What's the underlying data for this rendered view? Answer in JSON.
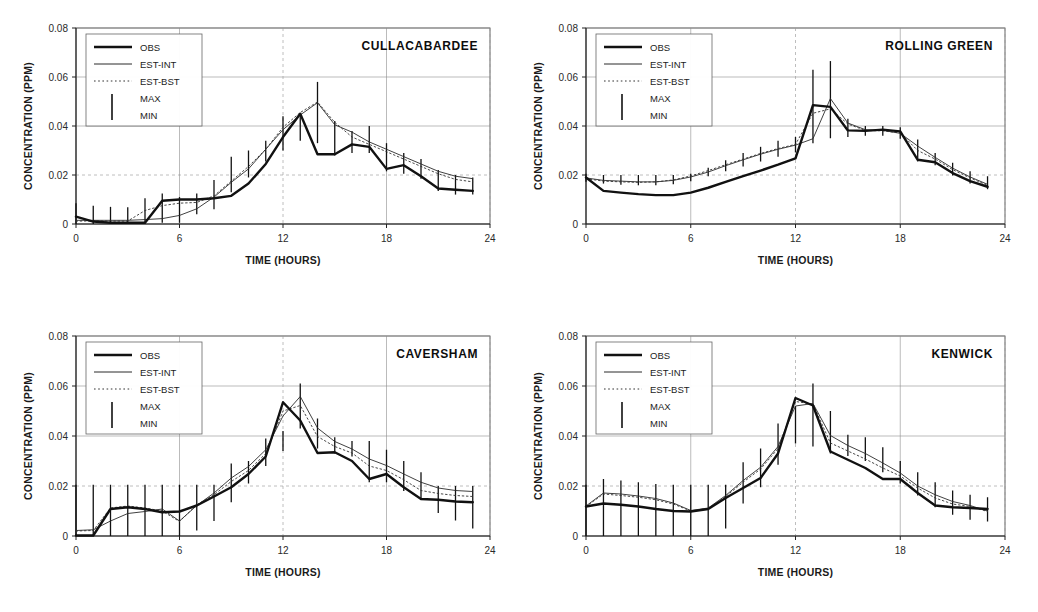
{
  "figure": {
    "panel_count": 4,
    "axis": {
      "xlabel": "TIME (HOURS)",
      "ylabel": "CONCENTRATION (PPM)",
      "xticks": [
        "0",
        "6",
        "12",
        "18",
        "24"
      ],
      "xtick_values": [
        0,
        6,
        12,
        18,
        24
      ],
      "yticks": [
        "0",
        "0.02",
        "0.04",
        "0.06",
        "0.08"
      ],
      "ytick_values": [
        0,
        0.02,
        0.04,
        0.06,
        0.08
      ],
      "xlim": [
        0,
        24
      ],
      "ylim": [
        0,
        0.08
      ],
      "grid": "dashed-light"
    },
    "legend": {
      "position": "top-left-inside",
      "entries": [
        {
          "label": "OBS",
          "marker": "thick-solid-line"
        },
        {
          "label": "EST-INT",
          "marker": "thin-solid-line"
        },
        {
          "label": "EST-BST",
          "marker": "dotted-line"
        },
        {
          "label": "MAX",
          "marker": "vertical-bar-top"
        },
        {
          "label": "MIN",
          "marker": "vertical-bar-bottom"
        }
      ]
    }
  },
  "chart_data": [
    {
      "type": "line",
      "title": "CULLACABARDEE",
      "xlabel": "TIME (HOURS)",
      "ylabel": "CONCENTRATION (PPM)",
      "xlim": [
        0,
        24
      ],
      "ylim": [
        0,
        0.08
      ],
      "x": [
        0,
        1,
        2,
        3,
        4,
        5,
        6,
        7,
        8,
        9,
        10,
        11,
        12,
        13,
        14,
        15,
        16,
        17,
        18,
        19,
        20,
        21,
        22,
        23
      ],
      "series": [
        {
          "name": "OBS",
          "values": [
            0.003,
            0.001,
            0.0005,
            0.0005,
            0.0005,
            0.0095,
            0.01,
            0.01,
            0.0105,
            0.0115,
            0.0165,
            0.0245,
            0.0355,
            0.045,
            0.0285,
            0.0285,
            0.0325,
            0.0315,
            0.0225,
            0.024,
            0.0195,
            0.0145,
            0.014,
            0.0135
          ]
        },
        {
          "name": "EST-INT",
          "values": [
            0.0015,
            0.0015,
            0.0015,
            0.0015,
            0.0018,
            0.0022,
            0.0035,
            0.0062,
            0.011,
            0.017,
            0.0225,
            0.0305,
            0.0385,
            0.0445,
            0.0495,
            0.0405,
            0.0375,
            0.0335,
            0.0305,
            0.0275,
            0.0245,
            0.0215,
            0.0195,
            0.0185
          ]
        },
        {
          "name": "EST-BST",
          "values": [
            0.0012,
            0.0012,
            0.0012,
            0.0012,
            0.0055,
            0.0075,
            0.0085,
            0.0088,
            0.0115,
            0.0175,
            0.0235,
            0.0305,
            0.0395,
            0.0455,
            0.0498,
            0.0415,
            0.0355,
            0.0325,
            0.0295,
            0.0265,
            0.0235,
            0.0205,
            0.0182,
            0.0172
          ]
        }
      ],
      "error_bars": {
        "name": "MAX-MIN",
        "max": [
          0.0085,
          0.0075,
          0.007,
          0.0068,
          0.0105,
          0.0125,
          0.011,
          0.0125,
          0.018,
          0.0275,
          0.03,
          0.034,
          0.044,
          0.045,
          0.058,
          0.042,
          0.038,
          0.04,
          0.033,
          0.029,
          0.0265,
          0.022,
          0.02,
          0.019
        ],
        "min": [
          0.0,
          0.0,
          0.0,
          0.0,
          0.0,
          0.0005,
          0.0005,
          0.004,
          0.006,
          0.013,
          0.019,
          0.0255,
          0.03,
          0.034,
          0.033,
          0.028,
          0.029,
          0.029,
          0.0215,
          0.0205,
          0.0185,
          0.0135,
          0.012,
          0.012
        ]
      }
    },
    {
      "type": "line",
      "title": "ROLLING GREEN",
      "xlabel": "TIME (HOURS)",
      "ylabel": "CONCENTRATION (PPM)",
      "xlim": [
        0,
        24
      ],
      "ylim": [
        0,
        0.08
      ],
      "x": [
        0,
        1,
        2,
        3,
        4,
        5,
        6,
        7,
        8,
        9,
        10,
        11,
        12,
        13,
        14,
        15,
        16,
        17,
        18,
        19,
        20,
        21,
        22,
        23
      ],
      "series": [
        {
          "name": "OBS",
          "values": [
            0.019,
            0.0135,
            0.0128,
            0.0122,
            0.0118,
            0.0118,
            0.0128,
            0.0148,
            0.0172,
            0.0195,
            0.0218,
            0.0242,
            0.0268,
            0.0485,
            0.0478,
            0.0382,
            0.038,
            0.0385,
            0.0378,
            0.0262,
            0.0252,
            0.0208,
            0.0175,
            0.0152
          ]
        },
        {
          "name": "EST-INT",
          "values": [
            0.0188,
            0.0178,
            0.0175,
            0.0172,
            0.0172,
            0.0178,
            0.0192,
            0.0212,
            0.0238,
            0.0262,
            0.0285,
            0.0305,
            0.0322,
            0.0348,
            0.0512,
            0.0412,
            0.0385,
            0.0382,
            0.037,
            0.0318,
            0.0272,
            0.0228,
            0.0192,
            0.0162
          ]
        },
        {
          "name": "EST-BST",
          "values": [
            0.0185,
            0.0175,
            0.0172,
            0.017,
            0.0172,
            0.018,
            0.0196,
            0.0218,
            0.0242,
            0.0265,
            0.0288,
            0.0308,
            0.0325,
            0.0452,
            0.047,
            0.0408,
            0.0382,
            0.038,
            0.0372,
            0.03,
            0.0265,
            0.0222,
            0.0188,
            0.0158
          ]
        }
      ],
      "error_bars": {
        "name": "MAX-MIN",
        "max": [
          0.0205,
          0.02,
          0.02,
          0.02,
          0.02,
          0.02,
          0.0205,
          0.023,
          0.026,
          0.029,
          0.0315,
          0.034,
          0.0355,
          0.063,
          0.0665,
          0.043,
          0.04,
          0.04,
          0.0395,
          0.0345,
          0.029,
          0.025,
          0.0215,
          0.0195
        ],
        "min": [
          0.0172,
          0.0165,
          0.016,
          0.0158,
          0.0158,
          0.0162,
          0.0175,
          0.0195,
          0.0215,
          0.0235,
          0.0255,
          0.0275,
          0.0292,
          0.033,
          0.035,
          0.0355,
          0.036,
          0.036,
          0.0348,
          0.0255,
          0.024,
          0.0198,
          0.0165,
          0.0142
        ]
      }
    },
    {
      "type": "line",
      "title": "CAVERSHAM",
      "xlabel": "TIME (HOURS)",
      "ylabel": "CONCENTRATION (PPM)",
      "xlim": [
        0,
        24
      ],
      "ylim": [
        0,
        0.08
      ],
      "x": [
        0,
        1,
        2,
        3,
        4,
        5,
        6,
        7,
        8,
        9,
        10,
        11,
        12,
        13,
        14,
        15,
        16,
        17,
        18,
        19,
        20,
        21,
        22,
        23
      ],
      "series": [
        {
          "name": "OBS",
          "values": [
            0.0002,
            0.0002,
            0.0108,
            0.0115,
            0.0108,
            0.0095,
            0.0098,
            0.0122,
            0.0158,
            0.0195,
            0.0248,
            0.0318,
            0.0535,
            0.0462,
            0.0332,
            0.0335,
            0.03,
            0.0228,
            0.0248,
            0.0195,
            0.0148,
            0.0145,
            0.0138,
            0.0135
          ]
        },
        {
          "name": "EST-INT",
          "values": [
            0.0022,
            0.0025,
            0.006,
            0.009,
            0.0098,
            0.0108,
            0.006,
            0.0122,
            0.0172,
            0.0232,
            0.0278,
            0.0345,
            0.048,
            0.0558,
            0.0432,
            0.0378,
            0.0348,
            0.0308,
            0.0282,
            0.0248,
            0.0215,
            0.0192,
            0.0182,
            0.0178
          ]
        },
        {
          "name": "EST-BST",
          "values": [
            0.002,
            0.0022,
            0.0112,
            0.012,
            0.0112,
            0.01,
            0.0058,
            0.0125,
            0.0165,
            0.0218,
            0.0262,
            0.033,
            0.05,
            0.0522,
            0.0398,
            0.0358,
            0.0332,
            0.028,
            0.0262,
            0.0225,
            0.0182,
            0.017,
            0.0162,
            0.0158
          ]
        }
      ],
      "error_bars": {
        "name": "MAX-MIN",
        "max": [
          0.0205,
          0.0205,
          0.0205,
          0.0205,
          0.0205,
          0.0205,
          0.0205,
          0.0205,
          0.0205,
          0.029,
          0.03,
          0.039,
          0.042,
          0.061,
          0.047,
          0.0395,
          0.038,
          0.038,
          0.0345,
          0.03,
          0.0255,
          0.02,
          0.02,
          0.02
        ],
        "min": [
          0.0,
          0.0,
          0.0,
          0.0,
          0.0,
          0.0,
          0.0,
          0.0022,
          0.006,
          0.0135,
          0.021,
          0.028,
          0.034,
          0.043,
          0.035,
          0.033,
          0.0318,
          0.0215,
          0.0215,
          0.018,
          0.0145,
          0.0092,
          0.0062,
          0.003
        ]
      }
    },
    {
      "type": "line",
      "title": "KENWICK",
      "xlabel": "TIME (HOURS)",
      "ylabel": "CONCENTRATION (PPM)",
      "xlim": [
        0,
        24
      ],
      "ylim": [
        0,
        0.08
      ],
      "x": [
        0,
        1,
        2,
        3,
        4,
        5,
        6,
        7,
        8,
        9,
        10,
        11,
        12,
        13,
        14,
        15,
        16,
        17,
        18,
        19,
        20,
        21,
        22,
        23
      ],
      "series": [
        {
          "name": "OBS",
          "values": [
            0.0118,
            0.013,
            0.0125,
            0.0118,
            0.0108,
            0.01,
            0.0098,
            0.0108,
            0.0152,
            0.0192,
            0.0232,
            0.033,
            0.0552,
            0.0522,
            0.0338,
            0.0305,
            0.0272,
            0.0228,
            0.0228,
            0.0172,
            0.0122,
            0.0115,
            0.0112,
            0.0108
          ]
        },
        {
          "name": "EST-INT",
          "values": [
            0.012,
            0.0172,
            0.0168,
            0.016,
            0.015,
            0.0132,
            0.0102,
            0.0112,
            0.0162,
            0.0222,
            0.0275,
            0.0358,
            0.052,
            0.053,
            0.0402,
            0.0362,
            0.033,
            0.0292,
            0.0252,
            0.02,
            0.0165,
            0.0138,
            0.0122,
            0.01
          ]
        },
        {
          "name": "EST-BST",
          "values": [
            0.0118,
            0.0168,
            0.0162,
            0.0155,
            0.0145,
            0.0128,
            0.01,
            0.011,
            0.0158,
            0.0215,
            0.0268,
            0.035,
            0.0538,
            0.0528,
            0.0372,
            0.034,
            0.0308,
            0.0272,
            0.024,
            0.0192,
            0.0152,
            0.0128,
            0.0118,
            0.0098
          ]
        }
      ],
      "error_bars": {
        "name": "MAX-MIN",
        "max": [
          0.0205,
          0.0228,
          0.0222,
          0.0215,
          0.0208,
          0.0205,
          0.0205,
          0.0205,
          0.0205,
          0.0295,
          0.035,
          0.045,
          0.052,
          0.061,
          0.05,
          0.0405,
          0.0395,
          0.0355,
          0.03,
          0.0255,
          0.0215,
          0.0182,
          0.0165,
          0.0155
        ],
        "min": [
          0.0,
          0.0,
          0.0,
          0.0,
          0.0,
          0.0,
          0.0,
          0.0,
          0.003,
          0.013,
          0.0195,
          0.0285,
          0.037,
          0.0358,
          0.033,
          0.032,
          0.03,
          0.0255,
          0.021,
          0.0162,
          0.0115,
          0.0085,
          0.0065,
          0.0058
        ]
      }
    }
  ]
}
